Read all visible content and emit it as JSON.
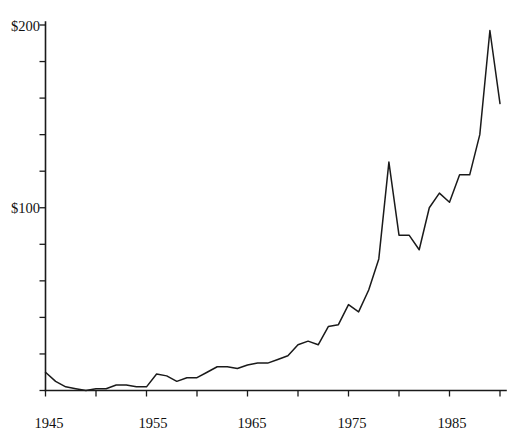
{
  "chart_data": {
    "type": "line",
    "title": "",
    "subtitle": "",
    "xlabel": "",
    "ylabel": "",
    "x": [
      1945,
      1946,
      1947,
      1948,
      1949,
      1950,
      1951,
      1952,
      1953,
      1954,
      1955,
      1956,
      1957,
      1958,
      1959,
      1960,
      1961,
      1962,
      1963,
      1964,
      1965,
      1966,
      1967,
      1968,
      1969,
      1970,
      1971,
      1972,
      1973,
      1974,
      1975,
      1976,
      1977,
      1978,
      1979,
      1980,
      1981,
      1982,
      1983,
      1984,
      1985,
      1986,
      1987,
      1988,
      1989,
      1990
    ],
    "values": [
      10,
      5,
      2,
      1,
      0,
      1,
      1,
      3,
      3,
      2,
      2,
      9,
      8,
      5,
      7,
      7,
      10,
      13,
      13,
      12,
      14,
      15,
      15,
      17,
      19,
      25,
      27,
      25,
      35,
      36,
      47,
      43,
      55,
      72,
      125,
      85,
      85,
      77,
      100,
      108,
      103,
      118,
      118,
      140,
      197,
      157
    ],
    "series": [
      {
        "name": "Price",
        "values": [
          10,
          5,
          2,
          1,
          0,
          1,
          1,
          3,
          3,
          2,
          2,
          9,
          8,
          5,
          7,
          7,
          10,
          13,
          13,
          12,
          14,
          15,
          15,
          17,
          19,
          25,
          27,
          25,
          35,
          36,
          47,
          43,
          55,
          72,
          125,
          85,
          85,
          77,
          100,
          108,
          103,
          118,
          118,
          140,
          197,
          157
        ]
      }
    ],
    "xlim": [
      1945,
      1990
    ],
    "ylim": [
      0,
      200
    ],
    "yticks": [
      0,
      20,
      40,
      60,
      80,
      100,
      120,
      140,
      160,
      180,
      200
    ],
    "ytick_labels": [
      "",
      "",
      "",
      "",
      "",
      "$100",
      "",
      "",
      "",
      "",
      "$200"
    ],
    "ytick_labels_shown": [
      "$100",
      "$200"
    ],
    "xticks": [
      1945,
      1950,
      1955,
      1960,
      1965,
      1970,
      1975,
      1980,
      1985,
      1990
    ],
    "xtick_labels": [
      "1945",
      "",
      "1955",
      "",
      "1965",
      "",
      "1975",
      "",
      "1985",
      ""
    ],
    "xtick_labels_shown": [
      "1945",
      "1955",
      "1965",
      "1975",
      "1985"
    ],
    "grid": false,
    "legend": false,
    "legend_position": "none",
    "line_color": "#1a1a1a",
    "background_color": "#ffffff",
    "annotations": []
  },
  "axis": {
    "y_label_top": "$200",
    "y_label_mid": "$100",
    "x_label_1": "1945",
    "x_label_2": "1955",
    "x_label_3": "1965",
    "x_label_4": "1975",
    "x_label_5": "1985"
  }
}
